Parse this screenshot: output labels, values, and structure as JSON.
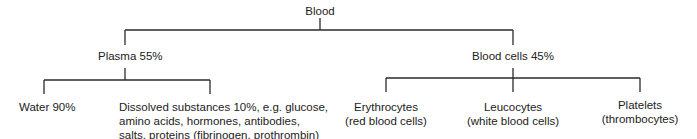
{
  "root": {
    "label": "Blood"
  },
  "branches": [
    {
      "label": "Plasma 55%",
      "children": [
        {
          "lines": [
            "Water 90%"
          ]
        },
        {
          "lines": [
            "Dissolved substances 10%, e.g. glucose,",
            "amino acids, hormones, antibodies,",
            "salts, proteins (fibrinogen, prothrombin)"
          ]
        }
      ]
    },
    {
      "label": "Blood cells 45%",
      "children": [
        {
          "lines": [
            "Erythrocytes",
            "(red blood cells)"
          ]
        },
        {
          "lines": [
            "Leucocytes",
            "(white blood cells)"
          ]
        },
        {
          "lines": [
            "Platelets",
            "(thrombocytes)"
          ]
        }
      ]
    }
  ]
}
